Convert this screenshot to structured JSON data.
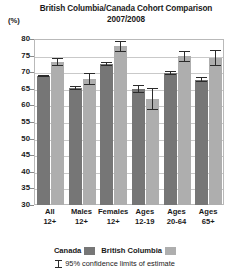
{
  "chart_data": {
    "type": "bar",
    "title": "British Columbia/Canada Cohort Comparison",
    "subtitle": "2007/2008",
    "ylabel": "(%)",
    "xlabel": "",
    "ylim": [
      30,
      80
    ],
    "yticks": [
      80,
      75,
      70,
      65,
      60,
      55,
      50,
      45,
      40,
      35,
      30
    ],
    "grid": true,
    "legend_position": "bottom",
    "categories": [
      "All 12+",
      "Males 12+",
      "Females 12+",
      "Ages 12-19",
      "Ages 20-64",
      "Ages 65+"
    ],
    "category_lines": [
      {
        "line1": "All",
        "line2": "12+"
      },
      {
        "line1": "Males",
        "line2": "12+"
      },
      {
        "line1": "Females",
        "line2": "12+"
      },
      {
        "line1": "Ages",
        "line2": "12-19"
      },
      {
        "line1": "Ages",
        "line2": "20-64"
      },
      {
        "line1": "Ages",
        "line2": "65+"
      }
    ],
    "series": [
      {
        "name": "Canada",
        "color": "#767676",
        "values": [
          68.8,
          65.2,
          72.5,
          65.0,
          69.8,
          67.8
        ],
        "ci_low": [
          68.4,
          64.5,
          71.9,
          63.8,
          69.3,
          66.9
        ],
        "ci_high": [
          69.2,
          65.9,
          73.1,
          66.2,
          70.3,
          68.7
        ]
      },
      {
        "name": "British Columbia",
        "color": "#aeaeae",
        "values": [
          73.0,
          68.0,
          77.8,
          61.8,
          74.8,
          74.3
        ],
        "ci_low": [
          71.8,
          66.2,
          76.2,
          58.5,
          73.2,
          71.9
        ],
        "ci_high": [
          74.2,
          69.8,
          79.4,
          65.1,
          76.4,
          76.7
        ]
      }
    ],
    "annotation": "95% confidence limits of estimate"
  },
  "legend": {
    "canada_label": "Canada",
    "bc_label": "British Columbia"
  },
  "footnote": {
    "text": "95% confidence limits of estimate"
  }
}
